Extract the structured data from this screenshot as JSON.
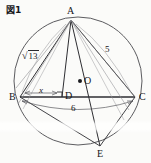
{
  "figure": {
    "caption": "図1",
    "type": "geometry-diagram",
    "background_color": "#fbfbf9",
    "stroke_color": "#3a3a3e",
    "points": [
      {
        "id": "A",
        "label": "A",
        "x": 71,
        "y": 20,
        "label_dx": -4,
        "label_dy": -14
      },
      {
        "id": "B",
        "label": "B",
        "x": 20,
        "y": 97,
        "label_dx": -11,
        "label_dy": -5
      },
      {
        "id": "C",
        "label": "C",
        "x": 135,
        "y": 97,
        "label_dx": 4,
        "label_dy": -5
      },
      {
        "id": "D",
        "label": "D",
        "x": 62,
        "y": 97,
        "label_dx": 3,
        "label_dy": -5
      },
      {
        "id": "O",
        "label": "O",
        "x": 80,
        "y": 81,
        "label_dx": 4,
        "label_dy": -5
      },
      {
        "id": "E",
        "label": "E",
        "x": 100,
        "y": 146,
        "label_dx": -3,
        "label_dy": 4
      }
    ],
    "measurements": [
      {
        "id": "AB",
        "label": "√13",
        "kind": "sqrt",
        "radicand": "13",
        "x": 27,
        "y": 51
      },
      {
        "id": "AC",
        "label": "5",
        "kind": "plain",
        "x": 107,
        "y": 49
      },
      {
        "id": "BD",
        "label": "x",
        "kind": "italic",
        "x": 41,
        "y": 90
      },
      {
        "id": "BC",
        "label": "6",
        "kind": "plain",
        "x": 74,
        "y": 108
      }
    ],
    "circle": {
      "cx": 78,
      "cy": 81,
      "r": 64
    },
    "center_dot": {
      "cx": 80,
      "cy": 81,
      "r": 2
    },
    "right_angle_at": "D",
    "segments": [
      {
        "from": "A",
        "to": "B",
        "name": "segment-ab"
      },
      {
        "from": "A",
        "to": "C",
        "name": "segment-ac"
      },
      {
        "from": "B",
        "to": "C",
        "name": "segment-bc"
      },
      {
        "from": "A",
        "to": "D",
        "name": "segment-ad-altitude"
      },
      {
        "from": "A",
        "to": "E",
        "name": "segment-ae-diameter"
      },
      {
        "from": "B",
        "to": "E",
        "name": "segment-be"
      },
      {
        "from": "C",
        "to": "E",
        "name": "segment-ce"
      },
      {
        "from": "A",
        "to": "O",
        "name": "segment-ao"
      }
    ],
    "dimension_lines": [
      {
        "id": "bd-dim",
        "label_ref": "BD",
        "from": "B",
        "to": "D"
      },
      {
        "id": "bc-dim",
        "label_ref": "BC",
        "from": "B",
        "to": "C"
      }
    ]
  }
}
